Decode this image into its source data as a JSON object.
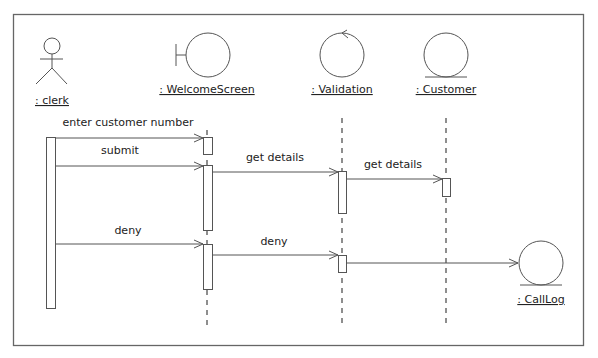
{
  "diagram": {
    "type": "UML sequence diagram (robustness stereotypes)",
    "colors": {
      "stroke": "#555555",
      "text": "#222222",
      "background": "#ffffff"
    },
    "participants": [
      {
        "id": "clerk",
        "label": ": clerk",
        "kind": "actor-icon"
      },
      {
        "id": "welcome",
        "label": ": WelcomeScreen",
        "kind": "boundary-icon"
      },
      {
        "id": "validation",
        "label": ": Validation",
        "kind": "control-icon"
      },
      {
        "id": "customer",
        "label": ": Customer",
        "kind": "entity-icon"
      },
      {
        "id": "calllog",
        "label": ": CallLog",
        "kind": "entity-icon"
      }
    ],
    "messages": [
      {
        "label": "enter customer number",
        "from": "clerk",
        "to": "welcome"
      },
      {
        "label": "submit",
        "from": "clerk",
        "to": "welcome"
      },
      {
        "label": "get details",
        "from": "welcome",
        "to": "validation"
      },
      {
        "label": "get details",
        "from": "validation",
        "to": "customer"
      },
      {
        "label": "deny",
        "from": "clerk",
        "to": "welcome"
      },
      {
        "label": "deny",
        "from": "welcome",
        "to": "validation"
      },
      {
        "label": "",
        "from": "validation",
        "to": "calllog"
      }
    ]
  }
}
